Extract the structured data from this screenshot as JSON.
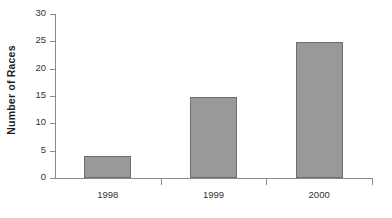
{
  "chart_data": {
    "type": "bar",
    "title": "",
    "subtitle": "",
    "xlabel": "",
    "ylabel": "Number of Races",
    "categories": [
      "1998",
      "1999",
      "2000"
    ],
    "values": [
      4,
      14.8,
      24.8
    ],
    "series": [
      {
        "name": "Number of Races",
        "values": [
          4,
          14.8,
          24.8
        ]
      }
    ],
    "ylim": [
      0,
      30
    ],
    "y_ticks": [
      0,
      5,
      10,
      15,
      20,
      25,
      30
    ],
    "y_tick_labels": [
      "0",
      "5",
      "10",
      "15",
      "20",
      "25",
      "30"
    ],
    "grid": false,
    "legend": false,
    "legend_position": "none",
    "annotations": [],
    "colors": {
      "bar_fill": "#999999",
      "bar_border": "#6e6e6e",
      "axis": "#8a8a8a",
      "text": "#333333",
      "axis_title": "#1f1f1f",
      "background": "#ffffff"
    }
  }
}
